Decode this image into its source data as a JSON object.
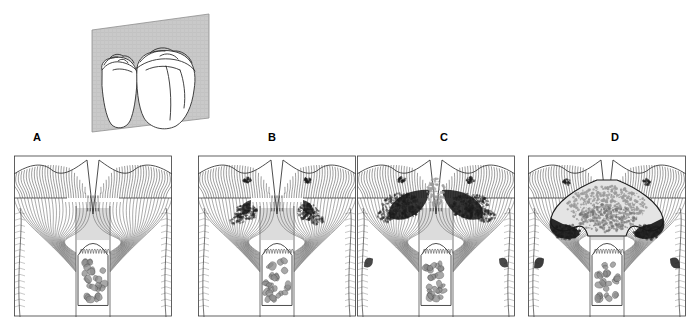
{
  "figure": {
    "type": "diagram",
    "background_color": "#ffffff",
    "line_color": "#3a3a3a",
    "lesion_dark_color": "#1a1a1a",
    "lesion_stipple_color": "#9a9a9a",
    "section_plane_color": "#c8c8c8",
    "pulp_cell_color": "#8c8c8c"
  },
  "inset": {
    "name": "three-dimensional-molar-inset",
    "description": "Two adjacent molars with a gray vertical sectioning plane passing through the proximal contact",
    "plane_color": "#c8c8c8",
    "tooth_fill": "#ffffff",
    "tooth_count": 2
  },
  "panels": [
    {
      "id": "A",
      "label": "A",
      "label_x": 33,
      "label_y": 132,
      "x": 14,
      "y": 146,
      "width": 158,
      "height": 171,
      "stage": "sound-enamel",
      "caption": "Sound teeth: intact enamel with no demineralization at the contact area",
      "lesion_size": 0,
      "lesions": []
    },
    {
      "id": "B",
      "label": "B",
      "label_x": 268,
      "label_y": 132,
      "x": 198,
      "y": 146,
      "width": 158,
      "height": 171,
      "stage": "incipient-lesion",
      "caption": "Incipient enamel caries: small subsurface demineralized zones below the contact point",
      "lesion_size": 1,
      "lesions": [
        "left-enamel-lesion",
        "right-enamel-lesion"
      ]
    },
    {
      "id": "C",
      "label": "C",
      "label_x": 440,
      "label_y": 132,
      "x": 357,
      "y": 146,
      "width": 158,
      "height": 171,
      "stage": "enamel-lesion-reaching-dej",
      "caption": "Advancing lesions spread laterally along the dentino-enamel junction",
      "lesion_size": 2,
      "lesions": [
        "left-enamel-lesion",
        "right-enamel-lesion",
        "dej-spread"
      ]
    },
    {
      "id": "D",
      "label": "D",
      "label_x": 611,
      "label_y": 132,
      "x": 528,
      "y": 146,
      "width": 158,
      "height": 171,
      "stage": "cavitation",
      "caption": "Cavitation with undermined enamel and extensive dentin involvement",
      "lesion_size": 3,
      "lesions": [
        "cavity-body",
        "undermined-enamel-left",
        "undermined-enamel-right"
      ]
    }
  ],
  "anatomy": {
    "enamel_label": "enamel",
    "dentin_label": "dentin",
    "pulp_label": "pulp chamber",
    "dej_label": "dentino-enamel junction",
    "odontoblast_label": "odontoblast layer",
    "enamel_rod_count": 60,
    "dentin_tubule_count": 46,
    "pulp_cell_count": 26
  }
}
